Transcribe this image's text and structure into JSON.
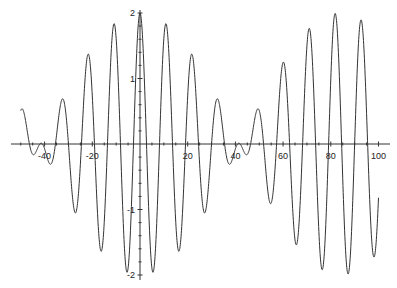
{
  "chart_data": {
    "type": "line",
    "title": "",
    "xlabel": "",
    "ylabel": "",
    "xlim": [
      -50,
      100
    ],
    "ylim": [
      -2,
      2
    ],
    "grid": false,
    "legend": null,
    "x_ticks": [
      -40,
      -20,
      20,
      40,
      60,
      80,
      100
    ],
    "x_tick_labels": [
      "-40",
      "-20",
      "20",
      "40",
      "60",
      "80",
      "100"
    ],
    "y_ticks": [
      -2,
      -1,
      1,
      2
    ],
    "y_tick_labels": [
      "-2",
      "-1",
      "1",
      "2"
    ],
    "function": "2*cos(0.0374*x)*cos(0.576*x)",
    "params": {
      "envelope_freq": 0.0374,
      "carrier_freq": 0.576,
      "amplitude": 2
    },
    "series": [
      {
        "name": "f(x)",
        "x_range": [
          -50,
          100
        ],
        "sample_points": [
          {
            "x": -50,
            "y": 0.6
          },
          {
            "x": -42,
            "y": 0.0
          },
          {
            "x": -32.7,
            "y": 0.55
          },
          {
            "x": -21.8,
            "y": 1.45
          },
          {
            "x": -10.9,
            "y": 1.83
          },
          {
            "x": 0,
            "y": 2.0
          },
          {
            "x": 10.9,
            "y": 1.83
          },
          {
            "x": 21.8,
            "y": 1.45
          },
          {
            "x": 32.7,
            "y": 0.55
          },
          {
            "x": 42,
            "y": 0.0
          },
          {
            "x": 49,
            "y": 0.65
          },
          {
            "x": 60,
            "y": 1.5
          },
          {
            "x": 71,
            "y": 1.85
          },
          {
            "x": 82,
            "y": 1.97
          },
          {
            "x": 93,
            "y": 1.8
          },
          {
            "x": 100,
            "y": -0.4
          }
        ],
        "color": "#333333"
      }
    ]
  },
  "plot": {
    "axis_color": "#333333",
    "line_color": "#333333"
  }
}
